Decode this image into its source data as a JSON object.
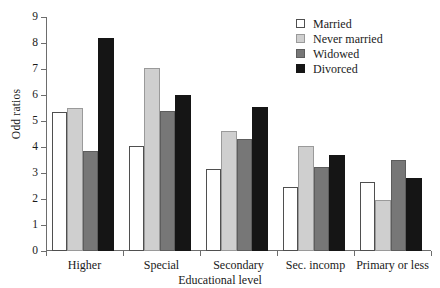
{
  "chart_data": {
    "type": "bar",
    "title": "",
    "xlabel": "Educational level",
    "ylabel": "Odd ratios",
    "ylim": [
      0,
      9
    ],
    "yticks": [
      0,
      1,
      2,
      3,
      4,
      5,
      6,
      7,
      8,
      9
    ],
    "grid": false,
    "legend_position": "top-right",
    "categories": [
      "Higher",
      "Special",
      "Secondary",
      "Sec. incomp",
      "Primary or less"
    ],
    "series": [
      {
        "name": "Married",
        "color": "#ffffff",
        "values": [
          5.35,
          4.05,
          3.15,
          2.45,
          2.65
        ]
      },
      {
        "name": "Never married",
        "color": "#cfcfcf",
        "values": [
          5.5,
          7.05,
          4.6,
          4.05,
          1.95
        ]
      },
      {
        "name": "Widowed",
        "color": "#777777",
        "values": [
          3.85,
          5.4,
          4.3,
          3.25,
          3.5
        ]
      },
      {
        "name": "Divorced",
        "color": "#151515",
        "values": [
          8.2,
          6.0,
          5.55,
          3.7,
          2.8
        ]
      }
    ]
  },
  "legend": {
    "items": [
      {
        "label": "Married"
      },
      {
        "label": "Never married"
      },
      {
        "label": "Widowed"
      },
      {
        "label": "Divorced"
      }
    ]
  }
}
